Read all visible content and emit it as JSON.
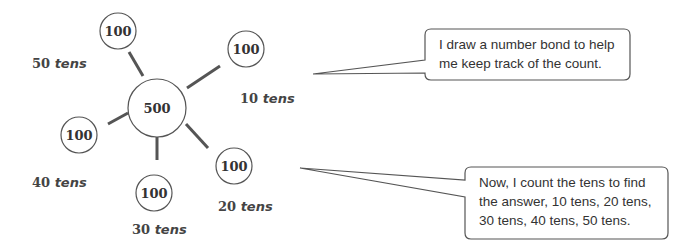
{
  "number_bond": {
    "whole": "500",
    "parts": [
      {
        "id": "top",
        "value": "100"
      },
      {
        "id": "top-right",
        "value": "100"
      },
      {
        "id": "bottom-right",
        "value": "100"
      },
      {
        "id": "bottom",
        "value": "100"
      },
      {
        "id": "left",
        "value": "100"
      }
    ]
  },
  "labels": {
    "ten_tens": {
      "num": "10",
      "unit": "tens"
    },
    "twenty_tens": {
      "num": "20",
      "unit": "tens"
    },
    "thirty_tens": {
      "num": "30",
      "unit": "tens"
    },
    "forty_tens": {
      "num": "40",
      "unit": "tens"
    },
    "fifty_tens": {
      "num": "50",
      "unit": "tens"
    }
  },
  "callouts": {
    "first": {
      "line1": "I draw a number bond to help",
      "line2": "me keep track of the count."
    },
    "second": {
      "line1": "Now, I count the tens to find",
      "line2": "the answer, 10 tens, 20 tens,",
      "line3": "30 tens, 40 tens, 50 tens."
    }
  },
  "colors": {
    "stroke": "#555555",
    "text": "#333333",
    "background": "#ffffff"
  }
}
